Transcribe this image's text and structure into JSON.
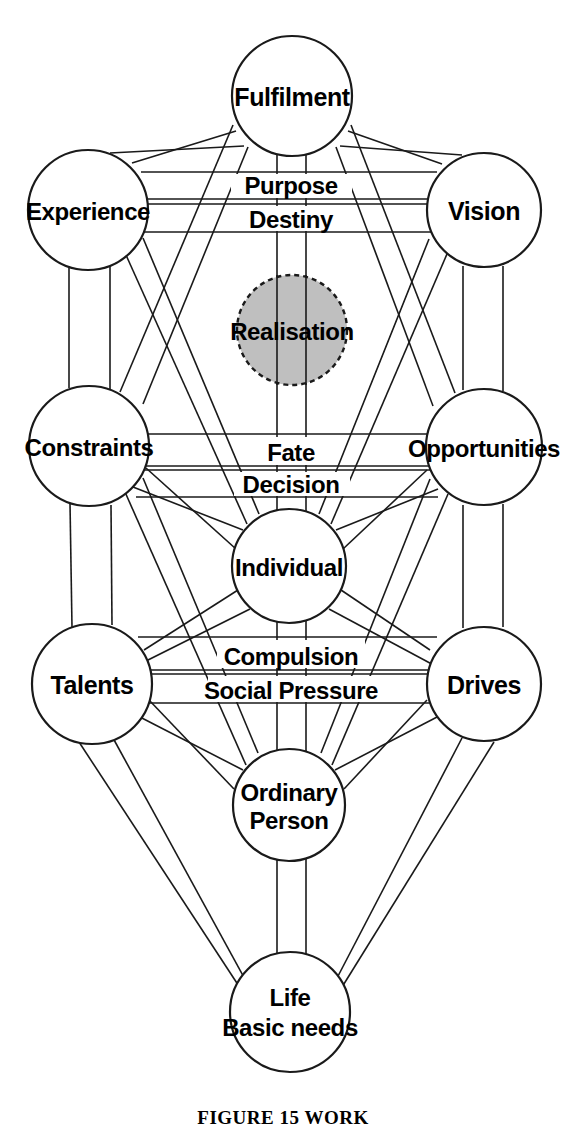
{
  "figure": {
    "caption": "FIGURE 15   WORK",
    "background_color": "#ffffff",
    "line_color": "#1a1a1a",
    "text_color": "#000000",
    "highlight_fill": "#bfbfbf"
  },
  "nodes": [
    {
      "id": "fulfilment",
      "label": "Fulfilment",
      "line2": "",
      "cx": 292,
      "cy": 96,
      "r": 60,
      "style": "solid",
      "font_size": 25
    },
    {
      "id": "experience",
      "label": "Experience",
      "line2": "",
      "cx": 88,
      "cy": 210,
      "r": 60,
      "style": "solid",
      "font_size": 24
    },
    {
      "id": "vision",
      "label": "Vision",
      "line2": "",
      "cx": 484,
      "cy": 210,
      "r": 57,
      "style": "solid",
      "font_size": 25
    },
    {
      "id": "realisation",
      "label": "Realisation",
      "line2": "",
      "cx": 292,
      "cy": 330,
      "r": 55,
      "style": "dashed",
      "font_size": 24
    },
    {
      "id": "constraints",
      "label": "Constraints",
      "line2": "",
      "cx": 89,
      "cy": 446,
      "r": 60,
      "style": "solid",
      "font_size": 24
    },
    {
      "id": "opportunities",
      "label": "Opportunities",
      "line2": "",
      "cx": 484,
      "cy": 447,
      "r": 58,
      "style": "solid",
      "font_size": 24
    },
    {
      "id": "individual",
      "label": "Individual",
      "line2": "",
      "cx": 289,
      "cy": 566,
      "r": 57,
      "style": "solid",
      "font_size": 24
    },
    {
      "id": "talents",
      "label": "Talents",
      "line2": "",
      "cx": 92,
      "cy": 684,
      "r": 60,
      "style": "solid",
      "font_size": 25
    },
    {
      "id": "drives",
      "label": "Drives",
      "line2": "",
      "cx": 484,
      "cy": 684,
      "r": 57,
      "style": "solid",
      "font_size": 25
    },
    {
      "id": "ordinary-person",
      "label": "Ordinary",
      "line2": "Person",
      "cx": 289,
      "cy": 805,
      "r": 56,
      "style": "solid",
      "font_size": 24
    },
    {
      "id": "life-basic-needs",
      "label": "Life",
      "line2": "Basic needs",
      "cx": 290,
      "cy": 1012,
      "r": 60,
      "style": "solid",
      "font_size": 24
    }
  ],
  "path_labels": [
    {
      "id": "purpose",
      "text": "Purpose",
      "x": 291,
      "y": 187,
      "font_size": 24
    },
    {
      "id": "destiny",
      "text": "Destiny",
      "x": 291,
      "y": 222,
      "font_size": 24
    },
    {
      "id": "fate",
      "text": "Fate",
      "x": 291,
      "y": 458,
      "font_size": 24
    },
    {
      "id": "decision",
      "text": "Decision",
      "x": 291,
      "y": 489,
      "font_size": 24
    },
    {
      "id": "compulsion",
      "text": "Compulsion",
      "x": 291,
      "y": 661,
      "font_size": 24
    },
    {
      "id": "social-pressure",
      "text": "Social Pressure",
      "x": 291,
      "y": 694,
      "font_size": 24
    }
  ],
  "edges": [
    {
      "id": "fulfilment-experience",
      "from": "fulfilment",
      "to": "experience"
    },
    {
      "id": "fulfilment-vision",
      "from": "fulfilment",
      "to": "vision"
    },
    {
      "id": "fulfilment-constraints",
      "from": "fulfilment",
      "to": "constraints"
    },
    {
      "id": "fulfilment-opportunities",
      "from": "fulfilment",
      "to": "opportunities"
    },
    {
      "id": "fulfilment-individual",
      "from": "fulfilment",
      "to": "individual"
    },
    {
      "id": "experience-vision-purpose",
      "from": "experience",
      "to": "vision"
    },
    {
      "id": "experience-vision-destiny",
      "from": "experience",
      "to": "vision"
    },
    {
      "id": "experience-constraints",
      "from": "experience",
      "to": "constraints"
    },
    {
      "id": "experience-individual",
      "from": "experience",
      "to": "individual"
    },
    {
      "id": "experience-talents",
      "from": "experience",
      "to": "talents"
    },
    {
      "id": "vision-opportunities",
      "from": "vision",
      "to": "opportunities"
    },
    {
      "id": "vision-individual",
      "from": "vision",
      "to": "individual"
    },
    {
      "id": "vision-drives",
      "from": "vision",
      "to": "drives"
    },
    {
      "id": "constraints-opportunities-a",
      "from": "constraints",
      "to": "opportunities"
    },
    {
      "id": "constraints-opportunities-b",
      "from": "constraints",
      "to": "opportunities"
    },
    {
      "id": "constraints-individual",
      "from": "constraints",
      "to": "individual"
    },
    {
      "id": "constraints-talents",
      "from": "constraints",
      "to": "talents"
    },
    {
      "id": "constraints-ordinary-person",
      "from": "constraints",
      "to": "ordinary-person"
    },
    {
      "id": "opportunities-individual",
      "from": "opportunities",
      "to": "individual"
    },
    {
      "id": "opportunities-drives",
      "from": "opportunities",
      "to": "drives"
    },
    {
      "id": "opportunities-ordinary",
      "from": "opportunities",
      "to": "ordinary-person"
    },
    {
      "id": "individual-talents",
      "from": "individual",
      "to": "talents"
    },
    {
      "id": "individual-drives",
      "from": "individual",
      "to": "drives"
    },
    {
      "id": "individual-ordinary-person",
      "from": "individual",
      "to": "ordinary-person"
    },
    {
      "id": "talents-drives-compulsion",
      "from": "talents",
      "to": "drives"
    },
    {
      "id": "talents-drives-social",
      "from": "talents",
      "to": "drives"
    },
    {
      "id": "talents-ordinary-person",
      "from": "talents",
      "to": "ordinary-person"
    },
    {
      "id": "talents-life",
      "from": "talents",
      "to": "life-basic-needs"
    },
    {
      "id": "drives-ordinary-person",
      "from": "drives",
      "to": "ordinary-person"
    },
    {
      "id": "drives-life",
      "from": "drives",
      "to": "life-basic-needs"
    },
    {
      "id": "ordinary-person-life",
      "from": "ordinary-person",
      "to": "life-basic-needs"
    },
    {
      "id": "central-pillar-left",
      "from": "fulfilment",
      "to": "life-basic-needs"
    },
    {
      "id": "central-pillar-right",
      "from": "fulfilment",
      "to": "life-basic-needs"
    }
  ]
}
